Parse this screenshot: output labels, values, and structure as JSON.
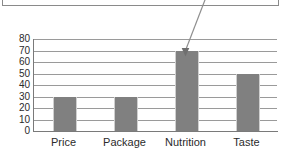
{
  "chart_data": {
    "type": "bar",
    "title": "",
    "subtitle": "",
    "xlabel": "",
    "ylabel": "",
    "categories": [
      "Price",
      "Package",
      "Nutrition",
      "Taste"
    ],
    "values": [
      30,
      30,
      70,
      50
    ],
    "series": [
      {
        "name": "Rating",
        "values": [
          30,
          30,
          70,
          50
        ]
      }
    ],
    "ylim": [
      0,
      80
    ],
    "ytick_labels": [
      "80",
      "70",
      "60",
      "50",
      "40",
      "30",
      "20",
      "10",
      "0"
    ],
    "ytick_values": [
      80,
      70,
      60,
      50,
      40,
      30,
      20,
      10,
      0
    ],
    "ytick_step": 10,
    "grid": true,
    "legend": false,
    "legend_position": "none",
    "bar_color": "#808080",
    "gridline_color": "#9a9a9a",
    "axis_color": "#7a7a7a",
    "annotation": {
      "type": "arrow",
      "target_category": "Nutrition",
      "target_value": 70,
      "label": ""
    }
  },
  "callout": {
    "text": "",
    "border_color": "#8a8a8a"
  }
}
